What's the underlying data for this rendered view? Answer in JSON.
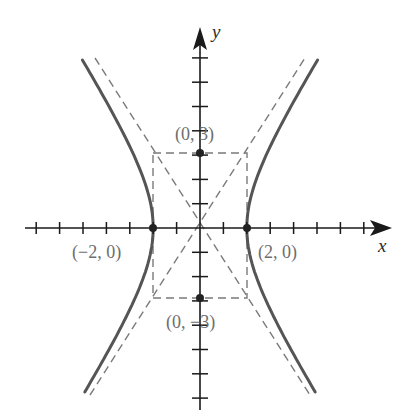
{
  "diagram": {
    "type": "hyperbola-graph",
    "equation": "x^2/4 - y^2/9 = 1",
    "axes": {
      "x_label": "x",
      "y_label": "y",
      "x_ticks": [
        -7,
        -6,
        -5,
        -4,
        -3,
        -2,
        -1,
        1,
        2,
        3,
        4,
        5,
        6,
        7
      ],
      "y_ticks": [
        -7,
        -6,
        -5,
        -4,
        -3,
        -2,
        -1,
        1,
        2,
        3,
        4,
        5,
        6,
        7
      ]
    },
    "points": [
      {
        "label": "(0, 3)",
        "x": 0,
        "y": 3
      },
      {
        "label": "(−2, 0)",
        "x": -2,
        "y": 0
      },
      {
        "label": "(2, 0)",
        "x": 2,
        "y": 0
      },
      {
        "label": "(0, −3)",
        "x": 0,
        "y": -3
      }
    ],
    "asymptotes": [
      "y = 3x/2",
      "y = -3x/2"
    ],
    "central_box": {
      "x_min": -2,
      "x_max": 2,
      "y_min": -3,
      "y_max": 3
    },
    "colors": {
      "curve": "#555555",
      "axis": "#1a1a1a",
      "dashed": "#7a7a7a",
      "label": "#6e6e6e"
    }
  }
}
